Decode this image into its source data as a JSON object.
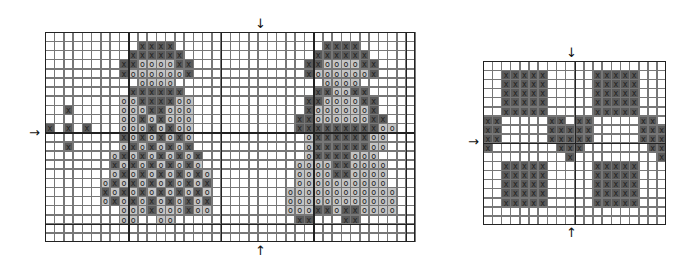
{
  "colors": {
    "dark": "#5a5a5a",
    "light": "#c4c4c4",
    "line": "#777777",
    "thick": "#222222",
    "bg": "#ffffff"
  },
  "legend_symbols": {
    "X": "dark cell with X",
    "O": "light cell with O",
    "x": "light cell with X",
    "o": "dark cell with O"
  },
  "main_chart": {
    "left": 45,
    "top": 32,
    "cols": 40,
    "rows": 23,
    "cell_w": 9.25,
    "cell_h": 9.13,
    "thick_cols": [
      9,
      19,
      29,
      39
    ],
    "thick_rows": [
      11,
      21
    ],
    "rows_data": [
      "........................................",
      "..........XXXX................XXXX......",
      ".........XXXXXX..............XXXXXX.....",
      "........XXOOOOXX............XXOOOOXX....",
      "........XOOOOOOX............XOOOOOOX....",
      "..........OOOO................OOOO......",
      ".........XXXXXX..............XXOOXX.....",
      "........OOXXXXOO............XXOOOOXX....",
      "..X.....OOOXXOOO............XOOOOOOX....",
      "........OOXOXOOO...........XXOOOOOOXX...",
      "X.X.X...OOOXOXOO...........XXXXXXXXXOO..",
      "........XOXOXOXO............OXXXXXXOO...",
      "..X.....OXOXOXOX............OXXXXXXOO...",
      ".......OXOXOXOXOX...........OXXXXOOO....",
      ".......XOXOXOXOXO..........OOOOXXOOOO...",
      ".......OXOXOXOXOXO.........OOOOXXOOOO...",
      "......OXOXOXOXOXOX.........OOOOOOOOOO...",
      "......XOXOXOXOXOXO........OOOOOOOOOOOO..",
      "......OXOXOXOXOXOX........OOOOOOOOOOOO..",
      "........OOOXOOOXOO........OOOXXOXXOOOO..",
      "........OO..OO.............XX...XX......",
      "........................................",
      "........................................"
    ]
  },
  "right_chart": {
    "left": 483,
    "top": 61,
    "cols": 20,
    "rows": 18,
    "cell_w": 9.15,
    "cell_h": 9.1,
    "thick_cols": [
      10
    ],
    "thick_rows": [
      9
    ],
    "rows_data": [
      "....................",
      "..XXXXX.....XXXXX...",
      "..XXXXX.....XXXXX...",
      "..XXXXX.....XXXXX...",
      "..XXXXX.....XXXXX...",
      "..XXXXX.....XXXXX...",
      "XX.....XX.XX.....XX.",
      "XX.....XXXXX.....XXX",
      "XX.....XXXXX.....XXX",
      "X.......XXX.......XX",
      ".........X.........X",
      "..XXXXX.....XXXXX...",
      "..XXXXX.....XXXXX...",
      "..XXXXX.....XXXXX...",
      "..XXXXX.....XXXXX...",
      "..XXXXX.....XXXXX...",
      "....................",
      "...................."
    ]
  },
  "arrows": [
    {
      "id": "main-top",
      "glyph": "↓",
      "x": 255,
      "y": 17
    },
    {
      "id": "main-bottom",
      "glyph": "↑",
      "x": 255,
      "y": 244
    },
    {
      "id": "main-left",
      "glyph": "→",
      "x": 29,
      "y": 126
    },
    {
      "id": "right-top",
      "glyph": "↓",
      "x": 566,
      "y": 46
    },
    {
      "id": "right-bottom",
      "glyph": "↑",
      "x": 566,
      "y": 226
    },
    {
      "id": "right-left",
      "glyph": "→",
      "x": 468,
      "y": 135
    }
  ]
}
